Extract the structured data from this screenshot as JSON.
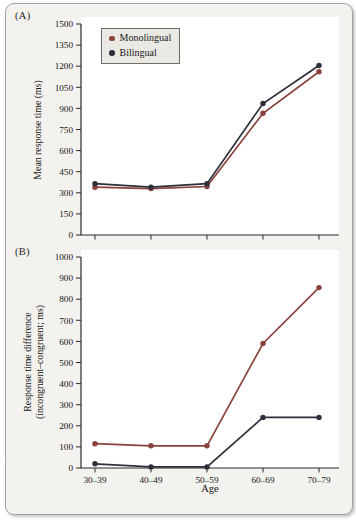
{
  "panel_labels": {
    "a": "(A)",
    "b": "(B)"
  },
  "legend": {
    "items": [
      {
        "label": "Monolingual",
        "color": "#8a423c"
      },
      {
        "label": "Bilingual",
        "color": "#2d303a"
      }
    ]
  },
  "cropped_caption_fragment": "t",
  "chart_data": [
    {
      "type": "line",
      "panel": "A",
      "title": "",
      "ylabel": "Mean response time (ms)",
      "xlabel": "",
      "ylim": [
        0,
        1500
      ],
      "yticks": [
        0,
        150,
        300,
        450,
        600,
        750,
        900,
        1050,
        1200,
        1350,
        1500
      ],
      "categories": [
        "30–39",
        "40–49",
        "50–59",
        "60–69",
        "70–79"
      ],
      "show_x_tick_labels": false,
      "grid": false,
      "legend_position": "top-left",
      "series": [
        {
          "name": "Monolingual",
          "color": "#8a423c",
          "values": [
            340,
            330,
            345,
            865,
            1160
          ]
        },
        {
          "name": "Bilingual",
          "color": "#2d303a",
          "values": [
            365,
            340,
            365,
            935,
            1205
          ]
        }
      ]
    },
    {
      "type": "line",
      "panel": "B",
      "title": "",
      "ylabel_lines": [
        "Response time difference",
        "(incongruent–congruent; ms)"
      ],
      "xlabel": "Age",
      "ylim": [
        0,
        1000
      ],
      "yticks": [
        0,
        100,
        200,
        300,
        400,
        500,
        600,
        700,
        800,
        900,
        1000
      ],
      "categories": [
        "30–39",
        "40–49",
        "50–59",
        "60–69",
        "70–79"
      ],
      "show_x_tick_labels": true,
      "grid": false,
      "series": [
        {
          "name": "Monolingual",
          "color": "#8a423c",
          "values": [
            115,
            105,
            105,
            590,
            855
          ]
        },
        {
          "name": "Bilingual",
          "color": "#2d303a",
          "values": [
            20,
            5,
            5,
            240,
            240
          ]
        }
      ]
    }
  ]
}
